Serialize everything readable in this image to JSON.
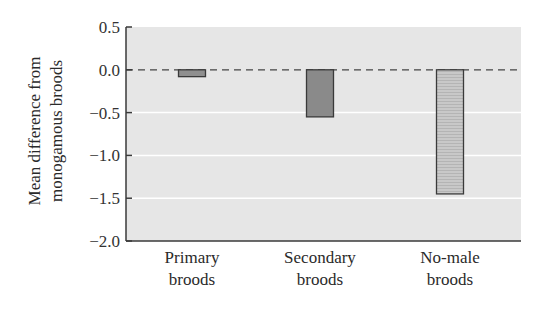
{
  "chart_data": {
    "type": "bar",
    "title": "",
    "xlabel": "",
    "ylabel": [
      "Mean difference from",
      "monogamous broods"
    ],
    "categories": [
      [
        "Primary",
        "broods"
      ],
      [
        "Secondary",
        "broods"
      ],
      [
        "No-male",
        "broods"
      ]
    ],
    "values": [
      -0.08,
      -0.55,
      -1.45
    ],
    "ylim": [
      -2.0,
      0.5
    ],
    "yticks": [
      0.5,
      0.0,
      -0.5,
      -1.0,
      -1.5,
      -2.0
    ],
    "ytick_labels": [
      "0.5",
      "0.0",
      "−0.5",
      "−1.0",
      "−1.5",
      "−2.0"
    ],
    "grid": true,
    "reference_line": {
      "y": 0.0,
      "style": "dashed"
    },
    "bar_fills": [
      "#8f8f8f",
      "#8a8a8a",
      "#c4c4c4"
    ],
    "bar_patterns": [
      "solid",
      "solid",
      "horizontal-lines"
    ],
    "colors": {
      "plot_background": "#e6e6e6",
      "gridline": "#ffffff",
      "axis": "#3a3a3a",
      "bar_edge": "#3a3a3a"
    }
  }
}
